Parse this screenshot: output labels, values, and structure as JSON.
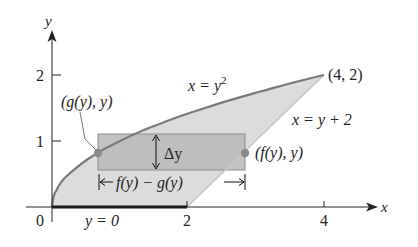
{
  "figure": {
    "type": "region-between-curves",
    "axes": {
      "x_label": "x",
      "y_label": "y",
      "x_ticks": [
        "0",
        "2",
        "4"
      ],
      "y_ticks": [
        "1",
        "2"
      ]
    },
    "curves": {
      "upper_left": "x = y²",
      "upper_left_main": "x = y",
      "upper_left_exp": "2",
      "right": "x = y + 2",
      "bottom": "y = 0"
    },
    "points": {
      "corner": "(4, 2)",
      "left": "(g(y), y)",
      "right": "(f(y), y)"
    },
    "strip": {
      "height_label": "Δy",
      "width_label": "f(y) − g(y)"
    },
    "colors": {
      "region": "#dcdcdc",
      "strip": "#b9b9b9",
      "strip_border": "#8c8c8c",
      "curve": "#7a7a7a",
      "line": "#bdbdbd",
      "dot": "#8a8a8a",
      "axis": "#222222"
    }
  }
}
